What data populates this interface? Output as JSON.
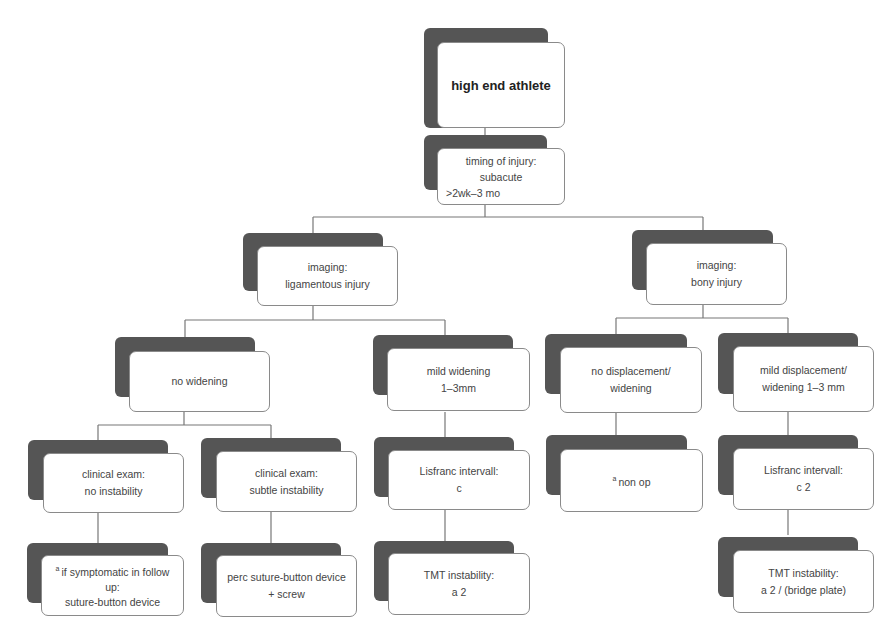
{
  "diagram": {
    "root": {
      "text": "high end athlete"
    },
    "timing": {
      "lines": [
        "timing of injury:",
        "subacute",
        ">2wk–3 mo"
      ]
    },
    "imaging_ligamentous": {
      "lines": [
        "imaging:",
        "ligamentous injury"
      ]
    },
    "imaging_bony": {
      "lines": [
        "imaging:",
        "bony injury"
      ]
    },
    "no_widening": {
      "lines": [
        "no widening"
      ]
    },
    "mild_widening": {
      "lines": [
        "mild widening",
        "1–3mm"
      ]
    },
    "no_displacement": {
      "lines": [
        "no displacement/",
        "widening"
      ]
    },
    "mild_displacement": {
      "lines": [
        "mild displacement/",
        "widening 1–3 mm"
      ]
    },
    "exam_no_instability": {
      "lines": [
        "clinical exam:",
        "no instability"
      ]
    },
    "exam_subtle_instability": {
      "lines": [
        "clinical exam:",
        "subtle instability"
      ]
    },
    "lisfranc_c": {
      "lines": [
        "Lisfranc intervall:",
        "c"
      ]
    },
    "non_op": {
      "superscript": "a",
      "text": "non op"
    },
    "lisfranc_c2": {
      "lines": [
        "Lisfranc intervall:",
        "c 2"
      ]
    },
    "if_symptomatic": {
      "superscript": "a",
      "lines": [
        "if symptomatic in follow",
        "up:",
        "suture-button device"
      ]
    },
    "perc_suture": {
      "lines": [
        "perc suture-button device",
        "+ screw"
      ]
    },
    "tmt_a2": {
      "lines": [
        "TMT instability:",
        "a 2"
      ]
    },
    "tmt_a2_bridge": {
      "lines": [
        "TMT instability:",
        "a 2 / (bridge plate)"
      ]
    }
  },
  "colors": {
    "shadow": "#555555",
    "border": "#8a8a8a",
    "line": "#777777",
    "text": "#444444"
  }
}
